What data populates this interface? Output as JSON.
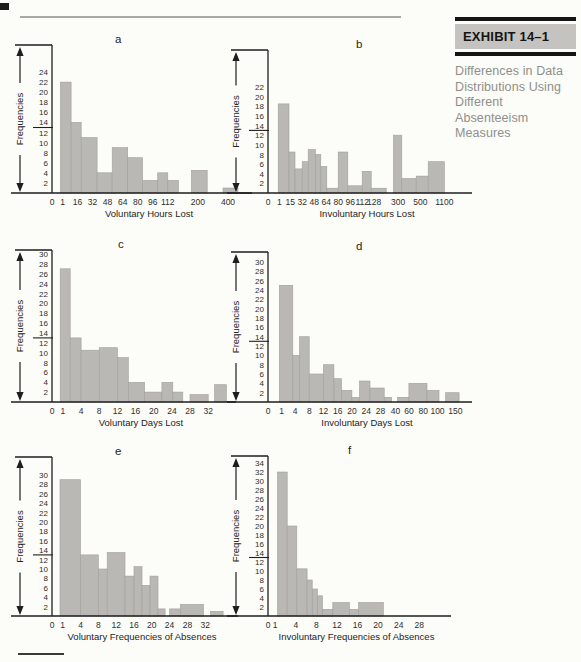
{
  "sidebar": {
    "exhibit_label": "EXHIBIT 14–1",
    "caption_lines": [
      "Differences in Data",
      "Distributions Using",
      "Different Absenteeism",
      "Measures"
    ]
  },
  "colors": {
    "bar_fill": "#b9b8b4",
    "bar_stroke": "#a19f9b",
    "axis": "#1e1e1e",
    "tick_text": "#2e2e2c",
    "label_text": "#242422"
  },
  "chart_data": [
    {
      "letter": "a",
      "type": "bar",
      "ylabel": "Frequencies",
      "xlabel": "Voluntary Hours Lost",
      "ymax": 24,
      "y_tick_step": 2,
      "mean_marker": 13,
      "grid": false,
      "x_tick_labels": [
        "0",
        "1",
        "16",
        "32",
        "48",
        "64",
        "80",
        "96",
        "112",
        "200",
        "400"
      ],
      "x_tick_pos": [
        0,
        0.7,
        1.7,
        2.7,
        3.7,
        4.7,
        5.7,
        6.7,
        7.7,
        9.7,
        11.7
      ],
      "axis_end": 12.9,
      "bars": [
        {
          "x0": 0.56,
          "x1": 1.27,
          "h": 22
        },
        {
          "x0": 1.27,
          "x1": 1.94,
          "h": 14
        },
        {
          "x0": 1.94,
          "x1": 3.0,
          "h": 11
        },
        {
          "x0": 3.0,
          "x1": 4.0,
          "h": 4
        },
        {
          "x0": 4.0,
          "x1": 5.03,
          "h": 9
        },
        {
          "x0": 5.03,
          "x1": 6.03,
          "h": 7
        },
        {
          "x0": 6.03,
          "x1": 7.03,
          "h": 2.5
        },
        {
          "x0": 7.03,
          "x1": 7.7,
          "h": 4
        },
        {
          "x0": 7.7,
          "x1": 8.41,
          "h": 2.5
        },
        {
          "x0": 9.27,
          "x1": 10.32,
          "h": 4.5
        },
        {
          "x0": 11.37,
          "x1": 12.37,
          "h": 1
        }
      ]
    },
    {
      "letter": "b",
      "type": "bar",
      "ylabel": "Frequencies",
      "xlabel": "Involuntary Hours Lost",
      "ymax": 22,
      "y_tick_step": 2,
      "mean_marker": 13,
      "grid": false,
      "x_tick_labels": [
        "0",
        "1",
        "15",
        "32",
        "48",
        "64",
        "80",
        "96",
        "112",
        "128",
        "300",
        "500",
        "1100"
      ],
      "x_tick_pos": [
        0,
        0.95,
        1.85,
        2.85,
        3.85,
        4.85,
        5.85,
        6.85,
        7.85,
        8.85,
        10.85,
        12.7,
        14.7
      ],
      "axis_end": 16.5,
      "bars": [
        {
          "x0": 0.85,
          "x1": 1.75,
          "h": 18.5
        },
        {
          "x0": 1.75,
          "x1": 2.25,
          "h": 8.5
        },
        {
          "x0": 2.25,
          "x1": 2.85,
          "h": 5
        },
        {
          "x0": 2.85,
          "x1": 3.35,
          "h": 6.5
        },
        {
          "x0": 3.35,
          "x1": 3.95,
          "h": 9
        },
        {
          "x0": 3.95,
          "x1": 4.4,
          "h": 8
        },
        {
          "x0": 4.4,
          "x1": 4.9,
          "h": 5.5
        },
        {
          "x0": 4.9,
          "x1": 5.85,
          "h": 1
        },
        {
          "x0": 5.85,
          "x1": 6.65,
          "h": 8.5
        },
        {
          "x0": 6.65,
          "x1": 7.85,
          "h": 1.5
        },
        {
          "x0": 7.85,
          "x1": 8.6,
          "h": 4.5
        },
        {
          "x0": 8.6,
          "x1": 9.85,
          "h": 1
        },
        {
          "x0": 10.45,
          "x1": 11.15,
          "h": 12
        },
        {
          "x0": 11.15,
          "x1": 12.35,
          "h": 3
        },
        {
          "x0": 12.35,
          "x1": 13.35,
          "h": 3.5
        },
        {
          "x0": 13.35,
          "x1": 14.7,
          "h": 6.5
        }
      ]
    },
    {
      "letter": "c",
      "type": "bar",
      "ylabel": "Frequencies",
      "xlabel": "Voluntary Days Lost",
      "ymax": 30,
      "y_tick_step": 2,
      "mean_marker": 13,
      "grid": false,
      "x_tick_labels": [
        "0",
        "1",
        "4",
        "8",
        "12",
        "16",
        "20",
        "24",
        "28",
        "32"
      ],
      "x_tick_pos": [
        0,
        0.6,
        1.6,
        2.6,
        3.6,
        4.6,
        5.6,
        6.6,
        7.6,
        8.6
      ],
      "axis_end": 9.8,
      "bars": [
        {
          "x0": 0.45,
          "x1": 1.0,
          "h": 27
        },
        {
          "x0": 1.0,
          "x1": 1.6,
          "h": 13
        },
        {
          "x0": 1.6,
          "x1": 2.6,
          "h": 10.5
        },
        {
          "x0": 2.6,
          "x1": 3.6,
          "h": 11
        },
        {
          "x0": 3.6,
          "x1": 4.2,
          "h": 9
        },
        {
          "x0": 4.2,
          "x1": 5.1,
          "h": 4
        },
        {
          "x0": 5.1,
          "x1": 6.05,
          "h": 2
        },
        {
          "x0": 6.05,
          "x1": 6.65,
          "h": 4
        },
        {
          "x0": 6.65,
          "x1": 7.2,
          "h": 2
        },
        {
          "x0": 7.6,
          "x1": 8.6,
          "h": 1.5
        },
        {
          "x0": 8.95,
          "x1": 9.6,
          "h": 3.5
        }
      ]
    },
    {
      "letter": "d",
      "type": "bar",
      "ylabel": "Frequencies",
      "xlabel": "Involuntary Days Lost",
      "ymax": 30,
      "y_tick_step": 2,
      "mean_marker": 13,
      "grid": false,
      "x_tick_labels": [
        "0",
        "1",
        "4",
        "8",
        "12",
        "16",
        "20",
        "24",
        "28",
        "40",
        "60",
        "80",
        "100",
        "150"
      ],
      "x_tick_pos": [
        0,
        0.95,
        1.9,
        2.9,
        3.9,
        4.9,
        5.9,
        6.9,
        7.9,
        8.95,
        9.9,
        10.9,
        11.9,
        13.15
      ],
      "axis_end": 13.9,
      "bars": [
        {
          "x0": 0.79,
          "x1": 1.74,
          "h": 25
        },
        {
          "x0": 1.74,
          "x1": 2.21,
          "h": 10
        },
        {
          "x0": 2.21,
          "x1": 2.89,
          "h": 14
        },
        {
          "x0": 2.89,
          "x1": 3.89,
          "h": 6
        },
        {
          "x0": 3.89,
          "x1": 4.63,
          "h": 8
        },
        {
          "x0": 4.63,
          "x1": 5.16,
          "h": 5
        },
        {
          "x0": 5.16,
          "x1": 5.89,
          "h": 2.5
        },
        {
          "x0": 5.89,
          "x1": 6.42,
          "h": 1
        },
        {
          "x0": 6.42,
          "x1": 7.16,
          "h": 4.5
        },
        {
          "x0": 7.16,
          "x1": 8.16,
          "h": 3
        },
        {
          "x0": 8.16,
          "x1": 8.68,
          "h": 1
        },
        {
          "x0": 9.1,
          "x1": 9.89,
          "h": 1
        },
        {
          "x0": 9.89,
          "x1": 11.16,
          "h": 4
        },
        {
          "x0": 11.16,
          "x1": 12.0,
          "h": 2.5
        },
        {
          "x0": 12.47,
          "x1": 13.42,
          "h": 2
        }
      ]
    },
    {
      "letter": "e",
      "type": "bar",
      "ylabel": "Frequencies",
      "xlabel": "Voluntary Frequencies of Absences",
      "ymax": 30,
      "y_tick_step": 2,
      "mean_marker": 13,
      "grid": false,
      "x_tick_labels": [
        "0",
        "1",
        "4",
        "8",
        "12",
        "16",
        "20",
        "24",
        "28",
        "32"
      ],
      "x_tick_pos": [
        0,
        0.6,
        1.6,
        2.6,
        3.6,
        4.6,
        5.6,
        6.6,
        7.6,
        8.6
      ],
      "axis_end": 10.1,
      "bars": [
        {
          "x0": 0.45,
          "x1": 1.6,
          "h": 29
        },
        {
          "x0": 1.6,
          "x1": 2.6,
          "h": 13
        },
        {
          "x0": 2.6,
          "x1": 3.1,
          "h": 10
        },
        {
          "x0": 3.1,
          "x1": 4.1,
          "h": 13.5
        },
        {
          "x0": 4.1,
          "x1": 4.6,
          "h": 8.5
        },
        {
          "x0": 4.6,
          "x1": 5.05,
          "h": 10.5
        },
        {
          "x0": 5.05,
          "x1": 5.5,
          "h": 6.5
        },
        {
          "x0": 5.5,
          "x1": 5.95,
          "h": 8.5
        },
        {
          "x0": 5.95,
          "x1": 6.35,
          "h": 1.5
        },
        {
          "x0": 6.6,
          "x1": 7.2,
          "h": 1.5
        },
        {
          "x0": 7.2,
          "x1": 8.5,
          "h": 2.5
        },
        {
          "x0": 8.9,
          "x1": 9.6,
          "h": 1
        }
      ]
    },
    {
      "letter": "f",
      "type": "bar",
      "ylabel": "Frequencies",
      "xlabel": "Involuntary Frequencies of Absences",
      "ymax": 34,
      "y_tick_step": 2,
      "mean_marker": 13,
      "grid": false,
      "x_tick_labels": [
        "0",
        "1",
        "4",
        "8",
        "12",
        "16",
        "20",
        "24",
        "28"
      ],
      "x_tick_pos": [
        0,
        0.35,
        1.35,
        2.35,
        3.35,
        4.35,
        5.35,
        6.35,
        7.35
      ],
      "axis_end": 8.6,
      "bars": [
        {
          "x0": 0.46,
          "x1": 0.93,
          "h": 32
        },
        {
          "x0": 0.93,
          "x1": 1.4,
          "h": 20
        },
        {
          "x0": 1.4,
          "x1": 1.9,
          "h": 10.5
        },
        {
          "x0": 1.9,
          "x1": 2.15,
          "h": 8
        },
        {
          "x0": 2.15,
          "x1": 2.4,
          "h": 6
        },
        {
          "x0": 2.4,
          "x1": 2.65,
          "h": 4.5
        },
        {
          "x0": 2.65,
          "x1": 3.15,
          "h": 1.5
        },
        {
          "x0": 3.15,
          "x1": 3.95,
          "h": 3
        },
        {
          "x0": 3.95,
          "x1": 4.4,
          "h": 1.5
        },
        {
          "x0": 4.4,
          "x1": 5.6,
          "h": 3
        }
      ]
    }
  ]
}
